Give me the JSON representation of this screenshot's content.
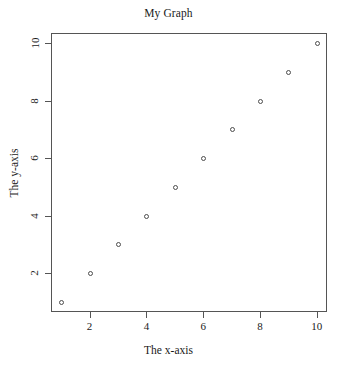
{
  "chart_data": {
    "type": "scatter",
    "title": "My Graph",
    "xlabel": "The x-axis",
    "ylabel": "The y-axis",
    "x": [
      1,
      2,
      3,
      4,
      5,
      6,
      7,
      8,
      9,
      10
    ],
    "y": [
      1,
      2,
      3,
      4,
      5,
      6,
      7,
      8,
      9,
      10
    ],
    "series": [
      {
        "name": "points",
        "x": [
          1,
          2,
          3,
          4,
          5,
          6,
          7,
          8,
          9,
          10
        ],
        "y": [
          1,
          2,
          3,
          4,
          5,
          6,
          7,
          8,
          9,
          10
        ]
      }
    ],
    "xlim": [
      0.64,
      10.36
    ],
    "ylim": [
      0.64,
      10.36
    ],
    "xticks": [
      2,
      4,
      6,
      8,
      10
    ],
    "yticks": [
      2,
      4,
      6,
      8,
      10
    ],
    "xticklabels": [
      "2",
      "4",
      "6",
      "8",
      "10"
    ],
    "yticklabels": [
      "2",
      "4",
      "6",
      "8",
      "10"
    ],
    "grid": false,
    "legend": false,
    "marker": "open-circle",
    "marker_color": "#4d4d4d",
    "frame_color": "#555555",
    "background": "#ffffff"
  }
}
